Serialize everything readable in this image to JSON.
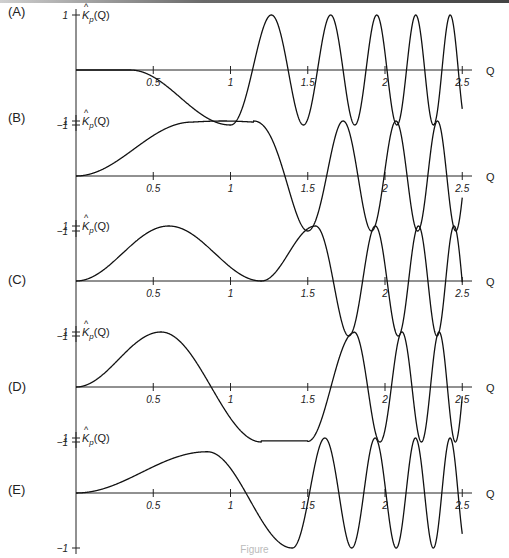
{
  "figure": {
    "caption": "Figure"
  },
  "chart_data": [
    {
      "type": "line",
      "panel": "(A)",
      "ylabel": "K̂_p(Q)",
      "xlabel": "Q",
      "xlim": [
        0,
        2.5
      ],
      "ylim": [
        -1,
        1
      ],
      "x_ticks": [
        "0.5",
        "1",
        "1.5",
        "2",
        "2.5"
      ],
      "y_ticks": [
        "1",
        "-1"
      ],
      "description": "Flat near 0 until ~0.4, dips to -1 at Q≈1.0, rises to +1 at Q≈1.3, then oscillates between -1 and +1 with increasing frequency up to 2.5",
      "key_points": [
        [
          0,
          0
        ],
        [
          0.4,
          0
        ],
        [
          0.7,
          -0.4
        ],
        [
          1.0,
          -1.0
        ],
        [
          1.15,
          0
        ],
        [
          1.3,
          1.0
        ],
        [
          1.5,
          -1.0
        ],
        [
          1.6,
          0
        ],
        [
          1.65,
          1.0
        ],
        [
          2.5,
          0.9
        ]
      ]
    },
    {
      "type": "line",
      "panel": "(B)",
      "ylabel": "K̂_p(Q)",
      "xlabel": "Q",
      "xlim": [
        0,
        2.5
      ],
      "ylim": [
        -1,
        1
      ],
      "x_ticks": [
        "0.5",
        "1",
        "1.5",
        "2",
        "2.5"
      ],
      "y_ticks": [
        "1",
        "-1"
      ],
      "description": "Rises smoothly from 0 to +1 by Q≈0.75, plateau at 1 until ~1.2, drops to -1 at Q≈1.55, then oscillates between ±1 with increasing frequency",
      "key_points": [
        [
          0,
          0
        ],
        [
          0.4,
          0.5
        ],
        [
          0.75,
          0.95
        ],
        [
          1.1,
          1.0
        ],
        [
          1.4,
          0
        ],
        [
          1.55,
          -1.0
        ],
        [
          1.8,
          1.0
        ],
        [
          2.5,
          0.9
        ]
      ]
    },
    {
      "type": "line",
      "panel": "(C)",
      "ylabel": "K̂_p(Q)",
      "xlabel": "Q",
      "xlim": [
        0,
        2.5
      ],
      "ylim": [
        -1,
        1
      ],
      "x_ticks": [
        "0.5",
        "1",
        "1.5",
        "2",
        "2.5"
      ],
      "y_ticks": [
        "1",
        "-1"
      ],
      "description": "Hump from 0 to +1 at Q≈0.65, returns to 0 at Q≈1.2, second hump +1 at Q≈1.55, then oscillates between ±1 with increasing frequency",
      "key_points": [
        [
          0,
          0
        ],
        [
          0.65,
          1.0
        ],
        [
          1.2,
          0
        ],
        [
          1.55,
          1.0
        ],
        [
          1.75,
          -1.0
        ],
        [
          1.9,
          1.0
        ],
        [
          2.5,
          -0.9
        ]
      ]
    },
    {
      "type": "line",
      "panel": "(D)",
      "ylabel": "K̂_p(Q)",
      "xlabel": "Q",
      "xlim": [
        0,
        2.5
      ],
      "ylim": [
        -1,
        1
      ],
      "x_ticks": [
        "0.5",
        "1",
        "1.5",
        "2",
        "2.5"
      ],
      "y_ticks": [
        "1",
        "-1"
      ],
      "description": "Hump to +1 at Q≈0.55, crosses zero at Q≈0.85, flat near -1 from ~1.2 to 1.5, rises to +1 at Q≈1.8, then oscillates between ±1 with increasing frequency",
      "key_points": [
        [
          0,
          0
        ],
        [
          0.55,
          1.0
        ],
        [
          0.85,
          0
        ],
        [
          1.2,
          -1.0
        ],
        [
          1.5,
          -0.95
        ],
        [
          1.65,
          0
        ],
        [
          1.8,
          1.0
        ],
        [
          1.95,
          -1.0
        ],
        [
          2.5,
          -0.9
        ]
      ]
    },
    {
      "type": "line",
      "panel": "(E)",
      "ylabel": "K̂_p(Q)",
      "xlabel": "Q",
      "xlim": [
        0,
        2.5
      ],
      "ylim": [
        -1,
        1
      ],
      "x_ticks": [
        "0.5",
        "1",
        "1.5",
        "2",
        "2.5"
      ],
      "y_ticks": [
        "1",
        "-1"
      ],
      "description": "Slow rise to ~0.75 at Q≈0.85, falls through zero at Q≈1.2, minimum -1 at Q≈1.4, then oscillates between ±1 with increasing frequency",
      "key_points": [
        [
          0,
          0
        ],
        [
          0.5,
          0.35
        ],
        [
          0.85,
          0.75
        ],
        [
          1.0,
          0.65
        ],
        [
          1.2,
          0
        ],
        [
          1.4,
          -1.0
        ],
        [
          1.5,
          0
        ],
        [
          1.6,
          1.0
        ],
        [
          2.5,
          0.4
        ]
      ]
    }
  ]
}
